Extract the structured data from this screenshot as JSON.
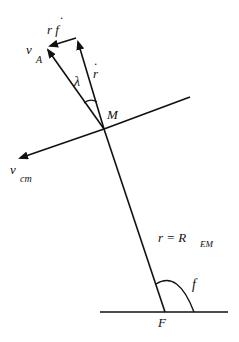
{
  "diagram": {
    "type": "vector geometry",
    "points": {
      "M": "M",
      "F": "F"
    },
    "labels": {
      "v_A": "v",
      "v_A_sub": "A",
      "r_f_dot": "r f",
      "r_f_dot_mark": "·",
      "r_dot": "r",
      "r_dot_mark": "·",
      "lambda": "λ",
      "v_cm": "v",
      "v_cm_sub": "cm",
      "r_eq": "r = R",
      "r_eq_sub": "EM",
      "f": "f"
    },
    "colors": {
      "line": "#111111",
      "background": "#ffffff"
    }
  }
}
